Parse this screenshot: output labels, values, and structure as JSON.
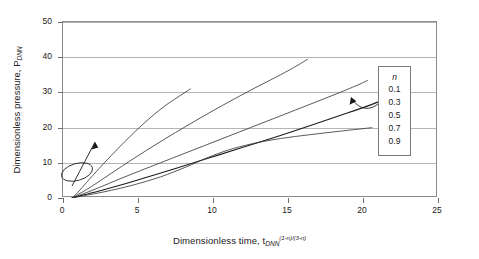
{
  "chart_data": {
    "type": "line",
    "title": "",
    "xlabel": "Dimensionless time, t",
    "xlabel_sub": "DNN",
    "xlabel_sup": "(1-n)/(3-n)",
    "ylabel": "Dimensionless pressure, P",
    "ylabel_sub": "DNN",
    "xlim": [
      0,
      25
    ],
    "ylim": [
      0,
      50
    ],
    "xticks": [
      "0",
      "5",
      "10",
      "15",
      "20",
      "25"
    ],
    "yticks": [
      "0",
      "10",
      "20",
      "30",
      "40",
      "50"
    ],
    "grid": "horizontal",
    "legend_position": "right-inside",
    "legend_title": "n",
    "series": [
      {
        "name": "0.1",
        "color": "#3b3b3b",
        "points": [
          [
            0.6,
            0
          ],
          [
            0.9,
            1.2
          ],
          [
            1.4,
            3.6
          ],
          [
            2.2,
            7.4
          ],
          [
            3.2,
            12.0
          ],
          [
            4.4,
            17.2
          ],
          [
            5.6,
            22.0
          ],
          [
            6.8,
            26.2
          ],
          [
            8.0,
            29.6
          ],
          [
            8.5,
            31.0
          ]
        ]
      },
      {
        "name": "0.3",
        "color": "#3b3b3b",
        "points": [
          [
            0.6,
            0
          ],
          [
            1.0,
            1.0
          ],
          [
            1.8,
            3.0
          ],
          [
            3.0,
            6.4
          ],
          [
            5.0,
            12.0
          ],
          [
            7.5,
            18.6
          ],
          [
            10.0,
            24.8
          ],
          [
            12.5,
            30.6
          ],
          [
            14.5,
            35.0
          ],
          [
            15.6,
            37.6
          ],
          [
            16.3,
            39.4
          ]
        ]
      },
      {
        "name": "0.5",
        "color": "#3b3b3b",
        "points": [
          [
            0.6,
            0
          ],
          [
            1.1,
            0.8
          ],
          [
            2.2,
            2.6
          ],
          [
            4.0,
            5.8
          ],
          [
            6.5,
            10.0
          ],
          [
            9.5,
            15.0
          ],
          [
            12.5,
            20.0
          ],
          [
            15.5,
            25.0
          ],
          [
            18.0,
            29.2
          ],
          [
            19.6,
            32.0
          ],
          [
            20.3,
            33.4
          ]
        ]
      },
      {
        "name": "0.7",
        "color": "#1c1c1c",
        "points": [
          [
            0.6,
            0
          ],
          [
            1.2,
            0.7
          ],
          [
            2.6,
            2.2
          ],
          [
            4.6,
            4.6
          ],
          [
            7.5,
            8.4
          ],
          [
            10.5,
            12.4
          ],
          [
            13.5,
            16.4
          ],
          [
            16.5,
            20.6
          ],
          [
            19.0,
            24.2
          ],
          [
            20.6,
            26.6
          ],
          [
            21.3,
            27.8
          ]
        ]
      },
      {
        "name": "0.9",
        "color": "#3b3b3b",
        "points": [
          [
            0.6,
            0
          ],
          [
            1.3,
            0.6
          ],
          [
            2.8,
            1.8
          ],
          [
            4.6,
            3.6
          ],
          [
            6.5,
            6.0
          ],
          [
            8.2,
            8.8
          ],
          [
            9.6,
            11.4
          ],
          [
            11.0,
            13.6
          ],
          [
            12.6,
            15.4
          ],
          [
            14.5,
            16.9
          ],
          [
            16.5,
            18.0
          ],
          [
            18.5,
            19.0
          ],
          [
            20.0,
            19.7
          ],
          [
            20.6,
            20.0
          ]
        ]
      }
    ],
    "annotations": [
      {
        "name": "increasing-n-arrow-origin",
        "type": "arrow-with-ellipse"
      },
      {
        "name": "increasing-n-arrow-legend",
        "type": "curved-arrow"
      }
    ]
  },
  "legend": {
    "title": "n",
    "items": [
      "0.1",
      "0.3",
      "0.5",
      "0.7",
      "0.9"
    ]
  }
}
